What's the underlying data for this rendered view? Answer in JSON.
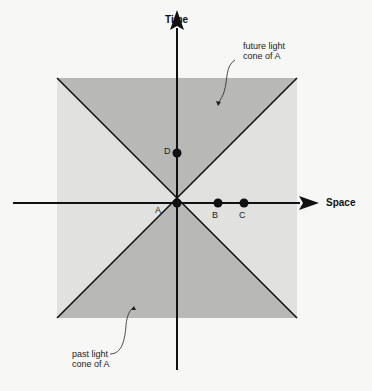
{
  "diagram": {
    "axes": {
      "vertical_label": "Time",
      "horizontal_label": "Space"
    },
    "annotations": {
      "future_cone": [
        "future light",
        "cone of A"
      ],
      "past_cone": [
        "past light",
        "cone of A"
      ]
    },
    "points": [
      {
        "label": "A",
        "x": 177,
        "y": 203
      },
      {
        "label": "B",
        "x": 218,
        "y": 203
      },
      {
        "label": "C",
        "x": 244,
        "y": 203
      },
      {
        "label": "D",
        "x": 177,
        "y": 152
      }
    ],
    "colors": {
      "background": "#f7f7f6",
      "outside_cone": "#e2e2e0",
      "inside_cone": "#b9b9b7",
      "lines": "#111111"
    }
  }
}
